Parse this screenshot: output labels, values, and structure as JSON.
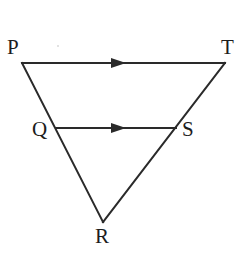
{
  "figure": {
    "background_color": "#ffffff",
    "stroke_color": "#2a2a2a",
    "label_color": "#1c1c1c",
    "stroke_width": 2,
    "vertices": [
      {
        "name": "P",
        "label": "P",
        "x": 22,
        "y": 63,
        "label_x": 7,
        "label_y": 37
      },
      {
        "name": "T",
        "label": "T",
        "x": 225,
        "y": 63,
        "label_x": 221,
        "label_y": 37
      },
      {
        "name": "Q",
        "label": "Q",
        "x": 56,
        "y": 128,
        "label_x": 32,
        "label_y": 119
      },
      {
        "name": "S",
        "label": "S",
        "x": 176,
        "y": 128,
        "label_x": 182,
        "label_y": 119
      },
      {
        "name": "R",
        "label": "R",
        "x": 103,
        "y": 222,
        "label_x": 95,
        "label_y": 226
      }
    ],
    "segments": [
      {
        "name": "PT",
        "from": "P",
        "to": "T",
        "x1": 22,
        "y1": 63,
        "x2": 225,
        "y2": 63,
        "arrow": true
      },
      {
        "name": "PR",
        "from": "P",
        "to": "R",
        "x1": 22,
        "y1": 63,
        "x2": 103,
        "y2": 222,
        "arrow": false
      },
      {
        "name": "TR",
        "from": "T",
        "to": "R",
        "x1": 225,
        "y1": 63,
        "x2": 103,
        "y2": 222,
        "arrow": false
      },
      {
        "name": "QS",
        "from": "Q",
        "to": "S",
        "x1": 56,
        "y1": 128,
        "x2": 176,
        "y2": 128,
        "arrow": true
      }
    ],
    "arrow_markers": [
      {
        "name": "arrow-on-PT",
        "segment": "PT",
        "tip_x": 126,
        "tip_y": 63,
        "width": 15,
        "height": 10
      },
      {
        "name": "arrow-on-QS",
        "segment": "QS",
        "tip_x": 126,
        "tip_y": 128,
        "width": 15,
        "height": 10
      }
    ]
  }
}
